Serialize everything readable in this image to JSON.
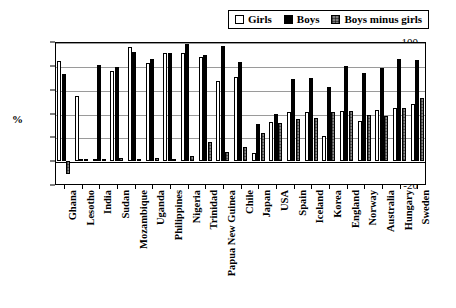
{
  "chart_data": {
    "type": "bar",
    "title": "",
    "subtitle": "",
    "xlabel": "",
    "ylabel": "%",
    "ylim": [
      -20,
      100
    ],
    "yticks": [
      -20,
      0,
      20,
      40,
      60,
      80,
      100
    ],
    "ytick_labels": [
      "-20",
      "0",
      "20",
      "40",
      "60",
      "80",
      "100"
    ],
    "grid": true,
    "grid_axis": "y",
    "legend_position": "top-right",
    "categories": [
      "Ghana",
      "Lesotho",
      "India",
      "Sudan",
      "Mozambique",
      "Uganda",
      "Philippines",
      "Nigeria",
      "Trinidad",
      "Papua New Guinea",
      "Chile",
      "Japan",
      "USA",
      "Spain",
      "Iceland",
      "Korea",
      "England",
      "Norway",
      "Australia",
      "Hungary",
      "Sweden"
    ],
    "series": [
      {
        "name": "Girls",
        "color": "#ffffff",
        "values": [
          84,
          55,
          2,
          76,
          96,
          82,
          91,
          91,
          87,
          67,
          71,
          7,
          33,
          41,
          41,
          21,
          42,
          34,
          43,
          45,
          48
        ]
      },
      {
        "name": "Boys",
        "color": "#000000",
        "values": [
          73,
          2,
          81,
          79,
          92,
          86,
          91,
          98,
          89,
          97,
          83,
          31,
          40,
          69,
          70,
          62,
          80,
          74,
          78,
          86,
          85
        ]
      },
      {
        "name": "Boys minus girls",
        "color": "#808080",
        "values": [
          -11,
          2,
          2,
          3,
          2,
          3,
          2,
          4,
          16,
          8,
          12,
          24,
          32,
          35,
          36,
          41,
          42,
          39,
          38,
          45,
          53
        ]
      }
    ]
  },
  "legend": {
    "entries": [
      {
        "label": "Girls",
        "swatch": "white-square-icon"
      },
      {
        "label": "Boys",
        "swatch": "black-square-icon"
      },
      {
        "label": "Boys minus girls",
        "swatch": "gray-hatched-square-icon"
      }
    ]
  }
}
